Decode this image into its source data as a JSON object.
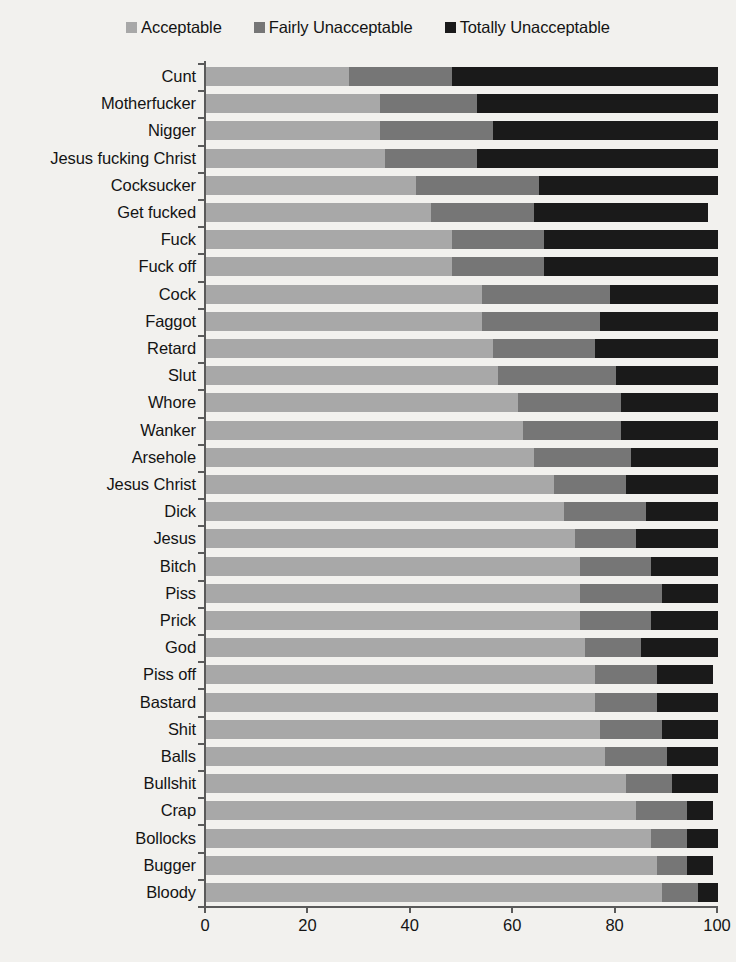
{
  "legend": {
    "items": [
      {
        "label": "Acceptable",
        "color": "#a8a8a8",
        "swatch_name": "legend-swatch-acceptable"
      },
      {
        "label": "Fairly Unacceptable",
        "color": "#767676",
        "swatch_name": "legend-swatch-fairly-unacceptable"
      },
      {
        "label": "Totally Unacceptable",
        "color": "#1a1a1a",
        "swatch_name": "legend-swatch-totally-unacceptable"
      }
    ]
  },
  "axis": {
    "x_ticks": [
      "0",
      "20",
      "40",
      "60",
      "80",
      "100"
    ],
    "x_min": 0,
    "x_max": 100
  },
  "chart_data": {
    "type": "bar",
    "orientation": "horizontal",
    "stacked": true,
    "stack_mode": "percent",
    "title": "",
    "xlabel": "",
    "ylabel": "",
    "xlim": [
      0,
      100
    ],
    "grid": false,
    "legend_position": "top",
    "series": [
      {
        "name": "Acceptable",
        "color": "#a8a8a8",
        "values": [
          28,
          34,
          34,
          35,
          41,
          44,
          48,
          48,
          54,
          54,
          56,
          57,
          61,
          62,
          64,
          68,
          70,
          72,
          73,
          73,
          73,
          74,
          76,
          76,
          77,
          78,
          82,
          84,
          87,
          88,
          89
        ]
      },
      {
        "name": "Fairly Unacceptable",
        "color": "#767676",
        "values": [
          20,
          19,
          22,
          18,
          24,
          20,
          18,
          18,
          25,
          23,
          20,
          23,
          20,
          19,
          19,
          14,
          16,
          12,
          14,
          16,
          14,
          11,
          12,
          12,
          12,
          12,
          9,
          10,
          7,
          6,
          7
        ]
      },
      {
        "name": "Totally Unacceptable",
        "color": "#1a1a1a",
        "values": [
          52,
          47,
          44,
          47,
          35,
          34,
          34,
          34,
          21,
          23,
          24,
          20,
          19,
          19,
          17,
          18,
          14,
          16,
          13,
          11,
          13,
          15,
          11,
          12,
          11,
          10,
          9,
          5,
          6,
          5,
          4
        ]
      }
    ],
    "categories": [
      "Cunt",
      "Motherfucker",
      "Nigger",
      "Jesus fucking Christ",
      "Cocksucker",
      "Get fucked",
      "Fuck",
      "Fuck off",
      "Cock",
      "Faggot",
      "Retard",
      "Slut",
      "Whore",
      "Wanker",
      "Arsehole",
      "Jesus Christ",
      "Dick",
      "Jesus",
      "Bitch",
      "Piss",
      "Prick",
      "God",
      "Piss off",
      "Bastard",
      "Shit",
      "Balls",
      "Bullshit",
      "Crap",
      "Bollocks",
      "Bugger",
      "Bloody"
    ]
  }
}
